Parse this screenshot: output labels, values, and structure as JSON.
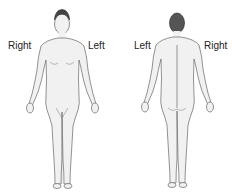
{
  "diagram": {
    "front_view": {
      "label_right": "Right",
      "label_left": "Left"
    },
    "back_view": {
      "label_left": "Left",
      "label_right": "Right"
    },
    "colors": {
      "skin": "#f1f1f1",
      "outline": "#555555",
      "hair": "#444444",
      "background": "#ffffff"
    }
  }
}
